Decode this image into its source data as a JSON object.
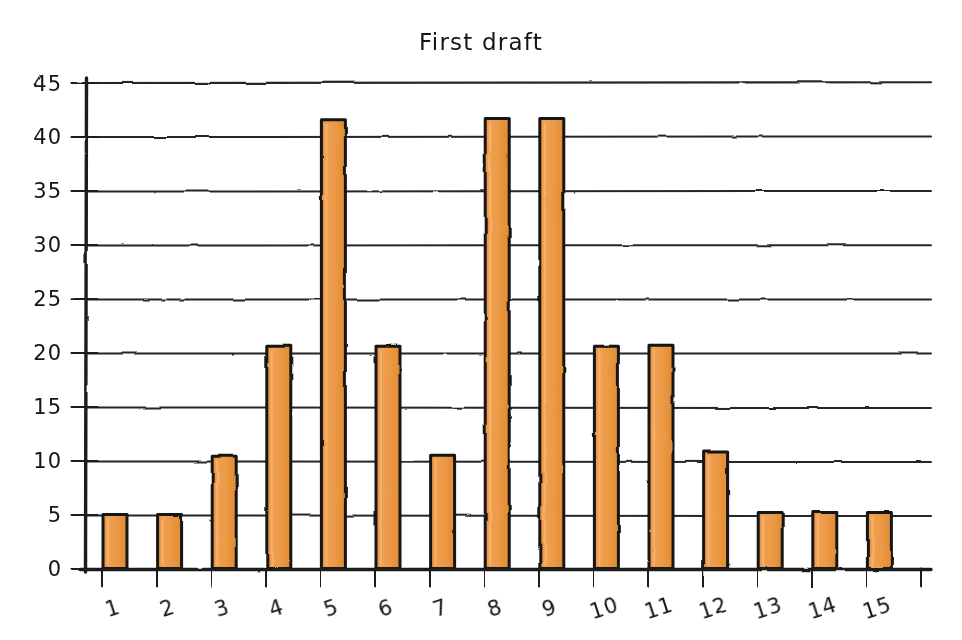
{
  "chart_data": {
    "type": "bar",
    "title": "First draft",
    "xlabel": "",
    "ylabel": "",
    "categories": [
      "1",
      "2",
      "3",
      "4",
      "5",
      "6",
      "7",
      "8",
      "9",
      "10",
      "11",
      "12",
      "13",
      "14",
      "15"
    ],
    "values": [
      5,
      5,
      10.4,
      20.6,
      41.6,
      20.6,
      10.5,
      41.7,
      41.7,
      20.6,
      20.7,
      10.8,
      5.2,
      5.2,
      5.2
    ],
    "ylim": [
      0,
      45
    ],
    "xlim": [
      0.4,
      15.9
    ],
    "yticks": [
      0,
      5,
      10,
      15,
      20,
      25,
      30,
      35,
      40,
      45
    ],
    "ytick_labels": [
      "0",
      "5",
      "10",
      "15",
      "20",
      "25",
      "30",
      "35",
      "40",
      "45"
    ],
    "grid": "horizontal",
    "legend": "none",
    "style": "hand-drawn",
    "bar_fill_color": "#ED9A43",
    "bar_edge_color": "#141414",
    "axis_color": "#1a1a1a",
    "grid_color": "#262626",
    "background_color": "#FFFFFF"
  }
}
